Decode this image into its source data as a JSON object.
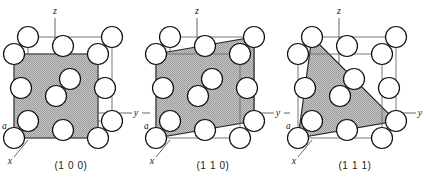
{
  "figure": {
    "background_color": "#ffffff",
    "line_color": "#3a3a3a",
    "atom_outline_color": "#111111",
    "atom_fill_color": "#ffffff",
    "plane_fill_color": "#b4b4b4",
    "plane_edge_color": "#1a1a1a",
    "axis_color": "#555555",
    "label_color": "#1a1a1a"
  },
  "panels": [
    {
      "id": "100",
      "caption": "(1 0 0)",
      "plane_type": "square",
      "plane_description": "Front face of the cube, fully shaded square",
      "axes": [
        {
          "name": "z-axis",
          "label": "z",
          "direction": "up"
        },
        {
          "name": "y-axis",
          "label": "y",
          "direction": "right"
        },
        {
          "name": "x-axis",
          "label": "x",
          "direction": "front-lower-left"
        }
      ],
      "lattice_parameter_label": "a",
      "atom_count": 14,
      "structure": "face-centered cubic"
    },
    {
      "id": "110",
      "caption": "(1 1 0)",
      "plane_type": "parallelogram",
      "plane_description": "Diagonal plane cutting through two opposite vertical edges",
      "axes": [
        {
          "name": "z-axis",
          "label": "z",
          "direction": "up"
        },
        {
          "name": "y-axis",
          "label": "y",
          "direction": "right"
        },
        {
          "name": "x-axis",
          "label": "x",
          "direction": "front-lower-left"
        }
      ],
      "lattice_parameter_label": "a",
      "atom_count": 14,
      "structure": "face-centered cubic"
    },
    {
      "id": "111",
      "caption": "(1 1 1)",
      "plane_type": "triangle",
      "plane_description": "Triangular plane joining the three axis intercepts",
      "axes": [
        {
          "name": "z-axis",
          "label": "z",
          "direction": "up"
        },
        {
          "name": "y-axis",
          "label": "y",
          "direction": "right"
        },
        {
          "name": "x-axis",
          "label": "x",
          "direction": "front-lower-left"
        }
      ],
      "lattice_parameter_label": "a",
      "atom_count": 14,
      "structure": "face-centered cubic"
    }
  ]
}
